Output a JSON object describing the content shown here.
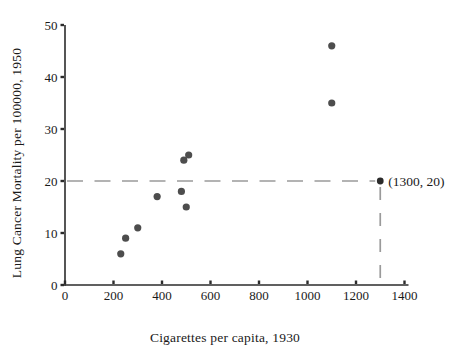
{
  "chart_data": {
    "type": "scatter",
    "title": "",
    "xlabel": "Cigarettes per capita, 1930",
    "ylabel": "Lung Cancer Mortality per 100000, 1950",
    "xlim": [
      0,
      1400
    ],
    "ylim": [
      0,
      50
    ],
    "x_ticks": [
      0,
      200,
      400,
      600,
      800,
      1000,
      1200,
      1400
    ],
    "y_ticks": [
      0,
      10,
      20,
      30,
      40,
      50
    ],
    "grid": false,
    "legend": false,
    "points": [
      {
        "x": 230,
        "y": 6
      },
      {
        "x": 250,
        "y": 9
      },
      {
        "x": 300,
        "y": 11
      },
      {
        "x": 380,
        "y": 17
      },
      {
        "x": 480,
        "y": 18
      },
      {
        "x": 500,
        "y": 15
      },
      {
        "x": 490,
        "y": 24
      },
      {
        "x": 510,
        "y": 25
      },
      {
        "x": 1100,
        "y": 35
      },
      {
        "x": 1100,
        "y": 46
      }
    ],
    "annotated_point": {
      "x": 1300,
      "y": 20,
      "label": "(1300, 20)"
    },
    "reference_lines": {
      "horizontal": {
        "y": 20,
        "from_x": 0,
        "to_x": 1300,
        "style": "dashed"
      },
      "vertical": {
        "x": 1300,
        "from_y": 0,
        "to_y": 20,
        "style": "dashed"
      }
    },
    "colors": {
      "point": "#4d4d4d",
      "annotated_point": "#2b2b2b",
      "axis": "#2b2b2b",
      "dashed_line": "#9a9a9a",
      "text": "#1a1a1a",
      "background": "#ffffff"
    }
  }
}
